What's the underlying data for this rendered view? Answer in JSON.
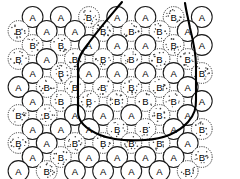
{
  "figure": {
    "width": 240,
    "height": 179,
    "background": "#ffffff",
    "line_color": "#000000",
    "circle_stroke": "#1a1a1a",
    "label_color": "#000000"
  },
  "legend": {
    "species_a_label": "A",
    "species_b_label": "B",
    "species_a_style": "solid-outline-plain-fill",
    "species_b_style": "dashed-outline-stippled-fill"
  },
  "geometry": {
    "radius": 10.4,
    "row_spacing": 14.0,
    "col_spacing": 28.2,
    "row_offset": 14.1,
    "first_row_y": 17.0,
    "row_even_x0": 18.5,
    "row_odd_x0": 32.6
  },
  "boundary": {
    "name": "cluster-boundary",
    "closed": true,
    "stroke_width": 2.1,
    "path": "M 122 2 C 112 14 98 30 88 44 C 81 53 78 58 78 64 L 78 112 C 78 122 88 130 100 135 C 112 140 128 141 145 140 C 162 139 178 133 188 122 C 195 114 196 108 196 100 L 196 66 C 196 52 193 40 190 28 C 188 18 186 10 185 3"
  },
  "grid": {
    "rows": [
      {
        "index": 0,
        "offset": true,
        "cells": [
          "A",
          "A",
          "B",
          "A",
          "A",
          "B",
          "A"
        ]
      },
      {
        "index": 1,
        "offset": false,
        "cells": [
          "B",
          "A",
          "A",
          "B",
          "B",
          "B",
          "A"
        ]
      },
      {
        "index": 2,
        "offset": true,
        "cells": [
          "B",
          "B",
          "A",
          "A",
          "A",
          "B",
          "A"
        ]
      },
      {
        "index": 3,
        "offset": false,
        "cells": [
          "B",
          "A",
          "B",
          "B",
          "B",
          "B",
          "B"
        ]
      },
      {
        "index": 4,
        "offset": true,
        "cells": [
          "A",
          "B",
          "A",
          "A",
          "A",
          "A",
          "B"
        ]
      },
      {
        "index": 5,
        "offset": false,
        "cells": [
          "A",
          "B",
          "B",
          "B",
          "B",
          "B",
          "A"
        ]
      },
      {
        "index": 6,
        "offset": true,
        "cells": [
          "A",
          "B",
          "B",
          "B",
          "B",
          "B",
          "A"
        ]
      },
      {
        "index": 7,
        "offset": false,
        "cells": [
          "B",
          "B",
          "A",
          "A",
          "A",
          "B",
          "A"
        ]
      },
      {
        "index": 8,
        "offset": true,
        "cells": [
          "A",
          "A",
          "A",
          "B",
          "B",
          "A",
          "B"
        ]
      },
      {
        "index": 9,
        "offset": false,
        "cells": [
          "B",
          "A",
          "B",
          "B",
          "B",
          "B",
          "A"
        ]
      },
      {
        "index": 10,
        "offset": true,
        "cells": [
          "A",
          "B",
          "A",
          "A",
          "A",
          "A",
          "B"
        ]
      },
      {
        "index": 11,
        "offset": false,
        "cells": [
          "A",
          "B",
          "A",
          "A",
          "A",
          "A",
          "B"
        ]
      }
    ]
  }
}
